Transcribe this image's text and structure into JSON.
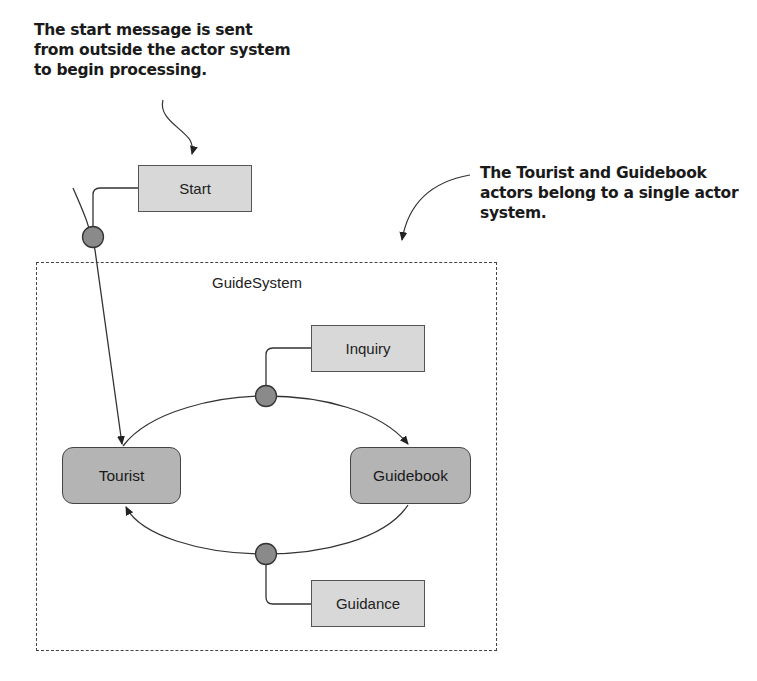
{
  "annotations": {
    "start_note": "The start message is sent from outside the actor system to begin processing.",
    "system_note": "The Tourist and Guidebook actors belong to a single actor system."
  },
  "actor_system": {
    "label": "GuideSystem"
  },
  "actors": [
    {
      "name": "Tourist"
    },
    {
      "name": "Guidebook"
    }
  ],
  "messages": [
    {
      "name": "Start",
      "from": "outside",
      "to": "Tourist"
    },
    {
      "name": "Inquiry",
      "from": "Tourist",
      "to": "Guidebook"
    },
    {
      "name": "Guidance",
      "from": "Guidebook",
      "to": "Tourist"
    }
  ],
  "colors": {
    "actor_fill": "#b4b4b4",
    "message_fill": "#d8d8d8",
    "connector_dot": "#8a8a8a",
    "line": "#333333"
  }
}
